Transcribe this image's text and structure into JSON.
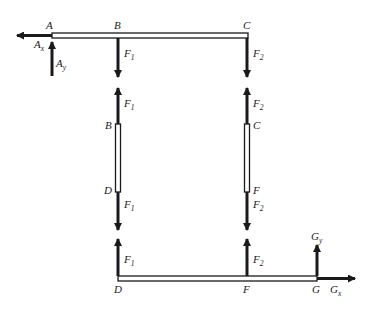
{
  "diagram": {
    "type": "free-body-diagram",
    "top_beam": {
      "points": [
        "A",
        "B",
        "C"
      ],
      "labels": {
        "A": "A",
        "B": "B",
        "C": "C"
      },
      "forces": [
        {
          "name": "Ax",
          "base": "A",
          "sub": "x",
          "direction": "left"
        },
        {
          "name": "Ay",
          "base": "A",
          "sub": "y",
          "direction": "up"
        },
        {
          "name": "F1",
          "base": "F",
          "sub": "1",
          "direction": "down",
          "at": "B"
        },
        {
          "name": "F2",
          "base": "F",
          "sub": "2",
          "direction": "down",
          "at": "C"
        }
      ]
    },
    "member_BD": {
      "labels": {
        "top": "B",
        "bottom": "D"
      },
      "forces": [
        {
          "name": "F1",
          "base": "F",
          "sub": "1",
          "direction": "up",
          "at": "B"
        },
        {
          "name": "F1",
          "base": "F",
          "sub": "1",
          "direction": "down",
          "at": "D"
        }
      ]
    },
    "member_CF": {
      "labels": {
        "top": "C",
        "bottom": "F"
      },
      "forces": [
        {
          "name": "F2",
          "base": "F",
          "sub": "2",
          "direction": "up",
          "at": "C"
        },
        {
          "name": "F2",
          "base": "F",
          "sub": "2",
          "direction": "down",
          "at": "F"
        }
      ]
    },
    "bottom_beam": {
      "points": [
        "D",
        "F",
        "G"
      ],
      "labels": {
        "D": "D",
        "F": "F",
        "G": "G"
      },
      "forces": [
        {
          "name": "F1",
          "base": "F",
          "sub": "1",
          "direction": "up",
          "at": "D"
        },
        {
          "name": "F2",
          "base": "F",
          "sub": "2",
          "direction": "up",
          "at": "F"
        },
        {
          "name": "Gy",
          "base": "G",
          "sub": "y",
          "direction": "up",
          "at": "G"
        },
        {
          "name": "Gx",
          "base": "G",
          "sub": "x",
          "direction": "right",
          "at": "G"
        }
      ]
    },
    "colors": {
      "ink": "#1a1a1a",
      "background": "#ffffff"
    }
  }
}
